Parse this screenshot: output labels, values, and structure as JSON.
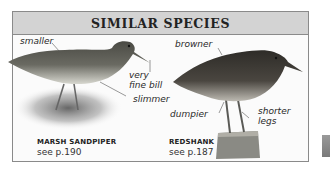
{
  "panel": {
    "title": "SIMILAR SPECIES"
  },
  "species": [
    {
      "name": "MARSH SANDPIPER",
      "reference": "see p.190",
      "annotations": [
        "smaller",
        "very",
        "fine bill",
        "slimmer"
      ]
    },
    {
      "name": "REDSHANK",
      "reference": "see p.187",
      "annotations": [
        "browner",
        "dumpier",
        "shorter",
        "legs"
      ]
    }
  ],
  "colors": {
    "header_bg": "#d3d3d3",
    "border": "#8a8a8a",
    "text": "#222222"
  }
}
